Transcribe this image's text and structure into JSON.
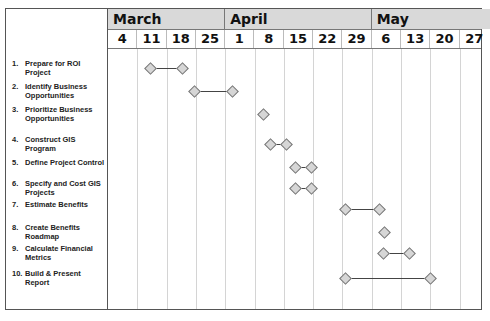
{
  "chart_data": {
    "type": "gantt",
    "title": "",
    "months": [
      {
        "label": "March",
        "weeks": [
          4,
          11,
          18,
          25
        ]
      },
      {
        "label": "April",
        "weeks": [
          1,
          8,
          15,
          22,
          29
        ]
      },
      {
        "label": "May",
        "weeks": [
          6,
          13,
          20,
          27
        ]
      }
    ],
    "week_columns": [
      "4",
      "11",
      "18",
      "25",
      "1",
      "8",
      "15",
      "22",
      "29",
      "6",
      "13",
      "20",
      "27"
    ],
    "tasks": [
      {
        "id": "1.",
        "label": "Prepare for ROI Project",
        "start": "Mar 11",
        "end": "Mar 18",
        "start_col": 1.45,
        "end_col": 2.55
      },
      {
        "id": "2.",
        "label": "Identify Business Opportunities",
        "start": "Mar 25",
        "end": "Apr 1",
        "start_col": 2.95,
        "end_col": 4.25
      },
      {
        "id": "3.",
        "label": "Prioritize Business Opportunities",
        "start": "Apr 8",
        "end": "Apr 8",
        "start_col": 5.3,
        "end_col": 5.3
      },
      {
        "id": "4.",
        "label": "Construct GIS Program",
        "start": "Apr 8",
        "end": "Apr 15",
        "start_col": 5.55,
        "end_col": 6.1
      },
      {
        "id": "5.",
        "label": "Define Project Control",
        "start": "Apr 15",
        "end": "Apr 22",
        "start_col": 6.4,
        "end_col": 6.95
      },
      {
        "id": "6.",
        "label": "Specify and Cost GIS Projects",
        "start": "Apr 15",
        "end": "Apr 22",
        "start_col": 6.4,
        "end_col": 6.95
      },
      {
        "id": "7.",
        "label": "Estimate Benefits",
        "start": "Apr 29",
        "end": "May 6",
        "start_col": 8.1,
        "end_col": 9.25
      },
      {
        "id": "8.",
        "label": "Create Benefits Roadmap",
        "start": "May 6",
        "end": "May 6",
        "start_col": 9.45,
        "end_col": 9.45
      },
      {
        "id": "9.",
        "label": "Calculate Financial Metrics",
        "start": "May 6",
        "end": "May 13",
        "start_col": 9.4,
        "end_col": 10.3
      },
      {
        "id": "10.",
        "label": "Build & Present Report",
        "start": "Apr 29",
        "end": "May 20",
        "start_col": 8.1,
        "end_col": 11.0
      }
    ],
    "xlabel": "",
    "ylabel": "",
    "grid": true,
    "legend": null
  },
  "layout": {
    "col_width": 29.3,
    "row_centers": [
      19,
      42,
      65,
      95,
      118,
      139,
      160,
      183,
      204,
      229
    ],
    "colors": {
      "header_bg": "#d9d9d9",
      "diamond_fill": "#d6d6d6",
      "diamond_border": "#777777",
      "gridline": "#d4d4d4",
      "bar": "#444444"
    }
  }
}
